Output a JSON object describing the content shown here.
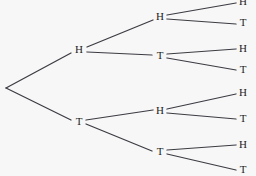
{
  "diagram": {
    "background_color": "#f7f7f8",
    "line_color": "#3b3b42",
    "text_color": "#1c1c20",
    "root": {
      "label": "",
      "x": 5,
      "y": 87
    },
    "levels": [
      {
        "name": "flip-1",
        "nodes": [
          {
            "id": "n-h",
            "label": "H",
            "x": 79,
            "y": 50
          },
          {
            "id": "n-t",
            "label": "T",
            "x": 79,
            "y": 122
          }
        ]
      },
      {
        "name": "flip-2",
        "nodes": [
          {
            "id": "n-hh",
            "label": "H",
            "x": 160,
            "y": 17
          },
          {
            "id": "n-ht",
            "label": "T",
            "x": 160,
            "y": 56
          },
          {
            "id": "n-th",
            "label": "H",
            "x": 160,
            "y": 111
          },
          {
            "id": "n-tt",
            "label": "T",
            "x": 160,
            "y": 152
          }
        ]
      },
      {
        "name": "flip-3",
        "nodes": [
          {
            "id": "n-hhh",
            "label": "H",
            "x": 243,
            "y": 2
          },
          {
            "id": "n-hht",
            "label": "T",
            "x": 243,
            "y": 23
          },
          {
            "id": "n-hth",
            "label": "H",
            "x": 243,
            "y": 49
          },
          {
            "id": "n-htt",
            "label": "T",
            "x": 243,
            "y": 70
          },
          {
            "id": "n-thh",
            "label": "H",
            "x": 243,
            "y": 93
          },
          {
            "id": "n-tht",
            "label": "T",
            "x": 243,
            "y": 119
          },
          {
            "id": "n-tth",
            "label": "H",
            "x": 243,
            "y": 145
          },
          {
            "id": "n-ttt",
            "label": "T",
            "x": 243,
            "y": 170
          }
        ]
      }
    ],
    "edges": [
      {
        "id": "e-root-h",
        "x1": 6,
        "y1": 88,
        "x2": 71,
        "y2": 53
      },
      {
        "id": "e-root-t",
        "x1": 6,
        "y1": 88,
        "x2": 71,
        "y2": 120
      },
      {
        "id": "e-h-hh",
        "x1": 87,
        "y1": 47,
        "x2": 153,
        "y2": 20
      },
      {
        "id": "e-h-ht",
        "x1": 87,
        "y1": 52,
        "x2": 152,
        "y2": 55
      },
      {
        "id": "e-t-th",
        "x1": 86,
        "y1": 120,
        "x2": 153,
        "y2": 110
      },
      {
        "id": "e-t-tt",
        "x1": 86,
        "y1": 124,
        "x2": 152,
        "y2": 151
      },
      {
        "id": "e-hh-hhh",
        "x1": 167,
        "y1": 15,
        "x2": 236,
        "y2": 3
      },
      {
        "id": "e-hh-hht",
        "x1": 167,
        "y1": 19,
        "x2": 236,
        "y2": 24
      },
      {
        "id": "e-ht-hth",
        "x1": 167,
        "y1": 54,
        "x2": 236,
        "y2": 49
      },
      {
        "id": "e-ht-htt",
        "x1": 167,
        "y1": 58,
        "x2": 236,
        "y2": 70
      },
      {
        "id": "e-th-thh",
        "x1": 167,
        "y1": 109,
        "x2": 236,
        "y2": 94
      },
      {
        "id": "e-th-tht",
        "x1": 167,
        "y1": 113,
        "x2": 236,
        "y2": 119
      },
      {
        "id": "e-tt-tth",
        "x1": 167,
        "y1": 150,
        "x2": 236,
        "y2": 145
      },
      {
        "id": "e-tt-ttt",
        "x1": 167,
        "y1": 154,
        "x2": 236,
        "y2": 170
      }
    ]
  }
}
